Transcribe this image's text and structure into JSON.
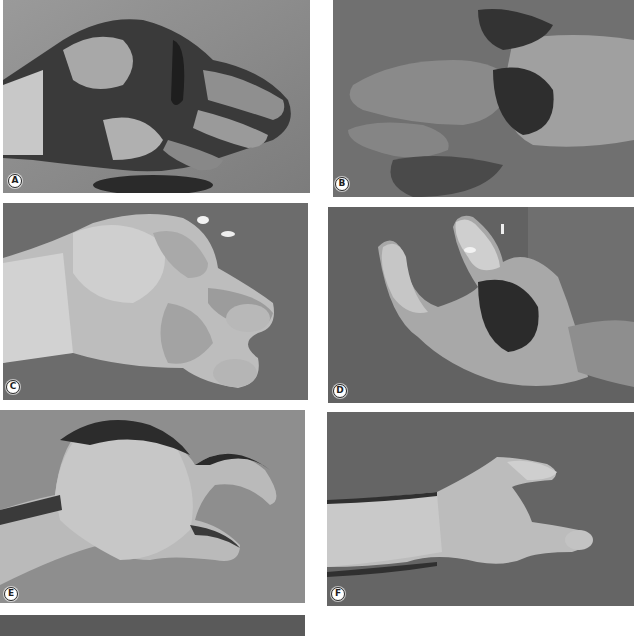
{
  "figure": {
    "panels": [
      {
        "id": "A",
        "label": "A",
        "description": "Severely mangled hand with extensive soft tissue injury, dorsal view"
      },
      {
        "id": "B",
        "label": "B",
        "description": "Mangled hand, alternate view showing exposed tissue and wounds"
      },
      {
        "id": "C",
        "label": "C",
        "description": "Hand after reconstruction with sutured flaps and pins"
      },
      {
        "id": "D",
        "label": "D",
        "description": "Hand with thumb and finger reconstruction, flap with dark necrotic area"
      },
      {
        "id": "E",
        "label": "E",
        "description": "Healed reconstructed hand with pinch between thumb and finger"
      },
      {
        "id": "F",
        "label": "F",
        "description": "Healed reconstructed hand, lateral view on forearm"
      },
      {
        "id": "G",
        "label": "",
        "description": "Additional panel partially visible at bottom"
      }
    ]
  },
  "colors": {
    "background": "#ffffff",
    "badge_fill": "#ffffff",
    "badge_text": "#1e1e1e",
    "photo_bg_dark": "#4a4a4a",
    "photo_bg_mid": "#7a7a7a",
    "skin_light": "#d8d8d8"
  }
}
